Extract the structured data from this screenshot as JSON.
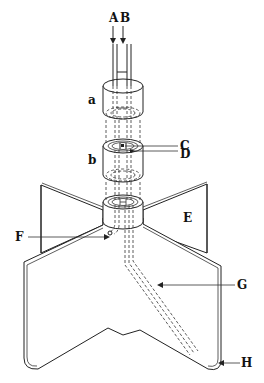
{
  "figure": {
    "colors": {
      "line": "#222222",
      "background": "#ffffff"
    },
    "labels": {
      "A": "A",
      "B": "B",
      "a": "a",
      "b": "b",
      "C": "C",
      "D": "D",
      "E": "E",
      "F": "F",
      "G": "G",
      "H": "H"
    },
    "parts": [
      {
        "id": "A",
        "role": "inlet tube A (arrow into top cap)"
      },
      {
        "id": "B",
        "role": "inlet tube B (arrow into top cap)"
      },
      {
        "id": "a",
        "role": "top cylindrical cap"
      },
      {
        "id": "b",
        "role": "middle cylindrical sleeve"
      },
      {
        "id": "C",
        "role": "inner bore"
      },
      {
        "id": "D",
        "role": "annular ring"
      },
      {
        "id": "E",
        "role": "vessel / fin plate"
      },
      {
        "id": "F",
        "role": "outlet port"
      },
      {
        "id": "G",
        "role": "angled internal channel"
      },
      {
        "id": "H",
        "role": "channel exit at vessel bottom"
      }
    ]
  }
}
